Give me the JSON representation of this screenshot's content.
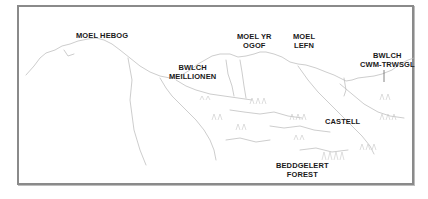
{
  "diagram": {
    "type": "panorama-sketch",
    "frame_color": "#8a8a8a",
    "line_color": "#b5b5b5",
    "label_color": "#1a1a1a"
  },
  "labels": {
    "moel_hebog": {
      "line1": "MOEL HEBOG"
    },
    "bwlch_meillionen": {
      "line1": "BWLCH",
      "line2": "MEILLIONEN"
    },
    "moel_yr_ogof": {
      "line1": "MOEL YR",
      "line2": "OGOF"
    },
    "moel_lefn": {
      "line1": "MOEL",
      "line2": "LEFN"
    },
    "bwlch_cwm_trwsgl": {
      "line1": "BWLCH",
      "line2": "CWM-TRWSGL"
    },
    "castell": {
      "line1": "CASTELL"
    },
    "beddgelert_forest": {
      "line1": "BEDDGELERT",
      "line2": "FOREST"
    }
  }
}
